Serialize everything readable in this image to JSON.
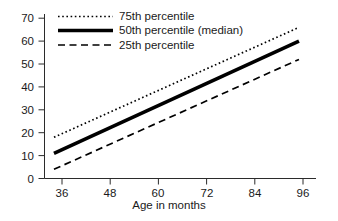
{
  "chart_data": {
    "type": "line",
    "title": "",
    "subtitle": "",
    "xlabel": "Age in months",
    "ylabel": "",
    "xlim": [
      34,
      98
    ],
    "ylim": [
      0,
      73
    ],
    "xticks": [
      36,
      48,
      60,
      72,
      84,
      96
    ],
    "yticks": [
      0,
      10,
      20,
      30,
      40,
      50,
      60,
      70
    ],
    "xtick_labels": [
      "36",
      "48",
      "60",
      "72",
      "84",
      "96"
    ],
    "ytick_labels": [
      "0",
      "10",
      "20",
      "30",
      "40",
      "50",
      "60",
      "70"
    ],
    "grid": false,
    "legend_position": "top-center",
    "x": [
      34,
      95
    ],
    "series": [
      {
        "name": "75th percentile",
        "values": [
          18,
          66
        ],
        "style": "dotted",
        "color": "#000000",
        "width": 1.6
      },
      {
        "name": "50th percentile (median)",
        "values": [
          11,
          60
        ],
        "style": "solid",
        "color": "#000000",
        "width": 3.4
      },
      {
        "name": "25th percentile",
        "values": [
          4,
          52
        ],
        "style": "dashed",
        "color": "#000000",
        "width": 1.6
      }
    ]
  },
  "axes": {
    "x_title": "Age in months",
    "x_tick_labels": [
      "36",
      "48",
      "60",
      "72",
      "84",
      "96"
    ],
    "y_tick_labels": [
      "70",
      "60",
      "50",
      "40",
      "30",
      "20",
      "10",
      "0"
    ]
  },
  "legend": {
    "entries": [
      {
        "label": "75th percentile",
        "sample": "dotted-line-sample"
      },
      {
        "label": "50th percentile (median)",
        "sample": "solid-thick-line-sample"
      },
      {
        "label": "25th percentile",
        "sample": "dashed-line-sample"
      }
    ]
  },
  "colors": {
    "ink": "#000000",
    "background": "#ffffff",
    "axis": "#2b2b2b"
  }
}
